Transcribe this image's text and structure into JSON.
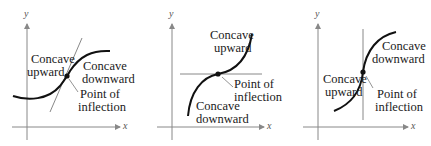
{
  "figure": {
    "panels": [
      {
        "id": "panel-1",
        "axis_labels": {
          "x": "x",
          "y": "y"
        },
        "tangent": "slanted",
        "labels": {
          "left_top": "Concave",
          "left_bottom": "upward",
          "right_top": "Concave",
          "right_bottom": "downward",
          "point_top": "Point of",
          "point_bottom": "inflection"
        }
      },
      {
        "id": "panel-2",
        "axis_labels": {
          "x": "x",
          "y": "y"
        },
        "tangent": "horizontal",
        "labels": {
          "upper_top": "Concave",
          "upper_bottom": "upward",
          "lower_top": "Concave",
          "lower_bottom": "downward",
          "point_top": "Point of",
          "point_bottom": "inflection"
        }
      },
      {
        "id": "panel-3",
        "axis_labels": {
          "x": "x",
          "y": "y"
        },
        "tangent": "vertical",
        "labels": {
          "right_top": "Concave",
          "right_bottom": "downward",
          "left_top": "Concave",
          "left_bottom": "upward",
          "point_top": "Point of",
          "point_bottom": "inflection"
        }
      }
    ],
    "colors": {
      "curve": "#111111",
      "tangent": "#777777",
      "axis": "#888888"
    }
  }
}
